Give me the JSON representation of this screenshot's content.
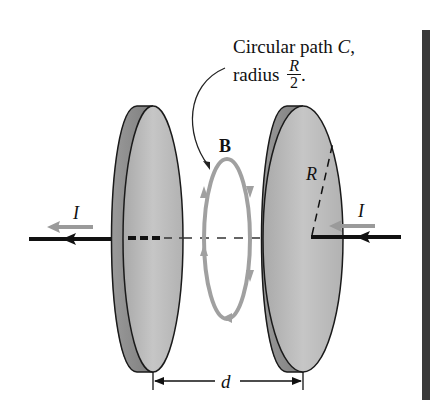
{
  "caption": {
    "line1_prefix": "Circular path ",
    "line1_var": "C",
    "line1_suffix": ",",
    "line2_prefix": "radius ",
    "fraction_numerator": "R",
    "fraction_denominator": "2",
    "line2_suffix": "."
  },
  "labels": {
    "field": "B",
    "radius": "R",
    "current_left": "I",
    "current_right": "I",
    "separation": "d"
  },
  "colors": {
    "plate_front": "#b8b8b8",
    "plate_edge": "#8f8f8f",
    "outline": "#1a1a1a",
    "wire": "#111111",
    "current_arrow": "#9a9a9a",
    "field_loop": "#a0a0a0",
    "edge_bar": "#3a3a3a"
  }
}
